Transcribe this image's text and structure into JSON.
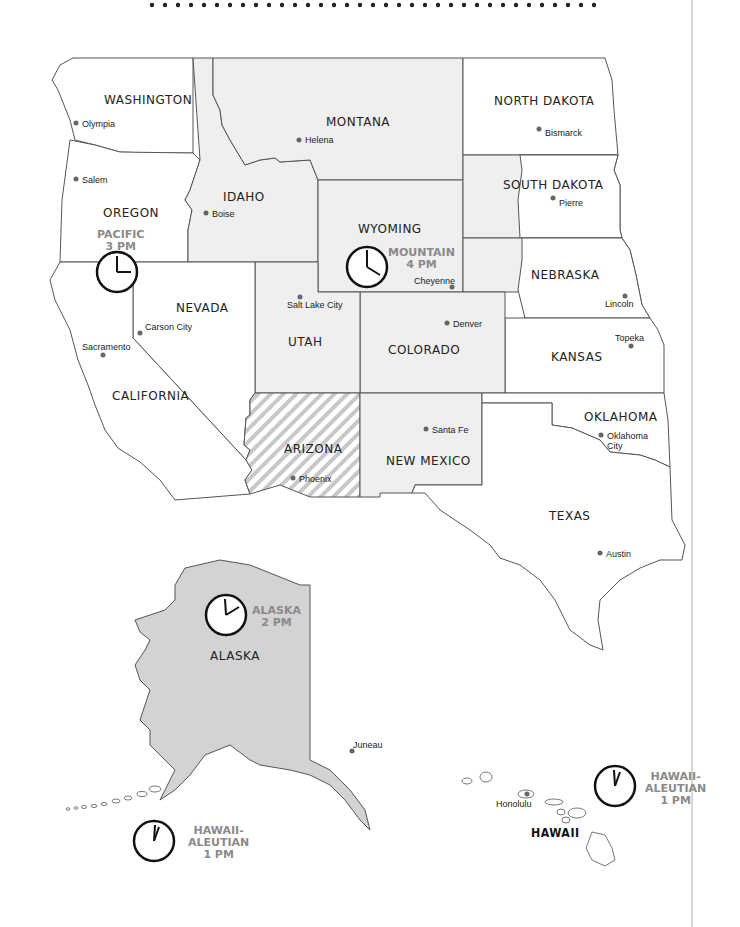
{
  "map": {
    "title_decoration": "dotted rule",
    "colors": {
      "mountain_fill": "#efefef",
      "alaska_fill": "#d3d3d3",
      "border": "#555555",
      "zone_label": "#8a8a8a",
      "hatch": "#c8c8c8"
    },
    "states": {
      "washington": "WASHINGTON",
      "oregon": "OREGON",
      "california": "CALIFORNIA",
      "nevada": "NEVADA",
      "idaho": "IDAHO",
      "montana": "MONTANA",
      "wyoming": "WYOMING",
      "utah": "UTAH",
      "colorado": "COLORADO",
      "arizona": "ARIZONA",
      "new_mexico": "NEW MEXICO",
      "north_dakota": "NORTH DAKOTA",
      "south_dakota": "SOUTH DAKOTA",
      "nebraska": "NEBRASKA",
      "kansas": "KANSAS",
      "oklahoma": "OKLAHOMA",
      "texas": "TEXAS",
      "alaska": "ALASKA",
      "hawaii": "HAWAII"
    },
    "cities": {
      "olympia": "Olympia",
      "salem": "Salem",
      "sacramento": "Sacramento",
      "carson_city": "Carson City",
      "boise": "Boise",
      "helena": "Helena",
      "salt_lake_city": "Salt Lake City",
      "cheyenne": "Cheyenne",
      "denver": "Denver",
      "phoenix": "Phoenix",
      "santa_fe": "Santa Fe",
      "bismarck": "Bismarck",
      "pierre": "Pierre",
      "lincoln": "Lincoln",
      "topeka": "Topeka",
      "oklahoma_city_1": "Oklahoma",
      "oklahoma_city_2": "City",
      "austin": "Austin",
      "juneau": "Juneau",
      "honolulu": "Honolulu"
    },
    "time_zones": {
      "pacific": {
        "name": "PACIFIC",
        "time": "3 PM"
      },
      "mountain": {
        "name": "MOUNTAIN",
        "time": "4 PM"
      },
      "alaska": {
        "name": "ALASKA",
        "time": "2 PM"
      },
      "hawaii_aleutian_1": {
        "name1": "HAWAII-",
        "name2": "ALEUTIAN",
        "time": "1 PM"
      },
      "hawaii_aleutian_2": {
        "name1": "HAWAII-",
        "name2": "ALEUTIAN",
        "time": "1 PM"
      }
    }
  }
}
